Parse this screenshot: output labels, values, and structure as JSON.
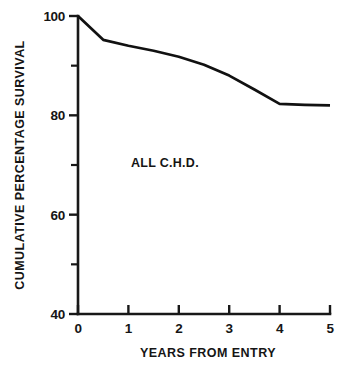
{
  "chart_data": {
    "type": "line",
    "title": "",
    "subtitle": "",
    "xlabel": "YEARS FROM ENTRY",
    "ylabel": "CUMULATIVE PERCENTAGE SURVIVAL",
    "xlim": [
      0,
      5
    ],
    "ylim": [
      40,
      100
    ],
    "grid": false,
    "legend": null,
    "annotations": [
      {
        "text": "ALL C.H.D.",
        "x": 1.05,
        "y": 69.5
      }
    ],
    "x_ticks": [
      {
        "value": 0,
        "label": "0",
        "type": "major"
      },
      {
        "value": 1,
        "label": "1",
        "type": "major"
      },
      {
        "value": 2,
        "label": "2",
        "type": "major"
      },
      {
        "value": 3,
        "label": "3",
        "type": "major"
      },
      {
        "value": 4,
        "label": "4",
        "type": "major"
      },
      {
        "value": 5,
        "label": "5",
        "type": "major"
      }
    ],
    "y_ticks": [
      {
        "value": 100,
        "label": "100",
        "type": "major"
      },
      {
        "value": 90,
        "label": "",
        "type": "minor"
      },
      {
        "value": 80,
        "label": "80",
        "type": "major"
      },
      {
        "value": 70,
        "label": "",
        "type": "minor"
      },
      {
        "value": 60,
        "label": "60",
        "type": "major"
      },
      {
        "value": 50,
        "label": "",
        "type": "minor"
      },
      {
        "value": 40,
        "label": "40",
        "type": "major"
      }
    ],
    "series": [
      {
        "name": "ALL C.H.D.",
        "color": "#111111",
        "x": [
          0,
          0.5,
          1,
          1.5,
          2,
          2.5,
          3,
          3.5,
          4,
          4.5,
          5
        ],
        "values": [
          100,
          95.2,
          94.0,
          93.0,
          91.8,
          90.2,
          88.0,
          85.2,
          82.3,
          82.1,
          82.0
        ]
      }
    ]
  },
  "colors": {
    "background": "#ffffff",
    "ink": "#151815",
    "curve": "#111111"
  }
}
